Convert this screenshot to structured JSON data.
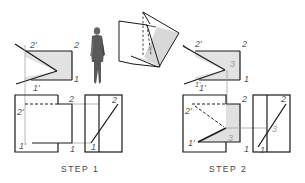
{
  "figure": {
    "steps": [
      {
        "caption": "STEP 1",
        "top_view": {
          "labels": {
            "p2_prime": "2'",
            "p2": "2",
            "p1": "1",
            "p1_prime": "1'"
          }
        },
        "front_view": {
          "labels": {
            "p2": "2",
            "p2_prime": "2'",
            "p1_prime": "1'",
            "p1": "1"
          }
        },
        "side_view": {
          "labels": {
            "p2": "2",
            "p1": "1"
          }
        }
      },
      {
        "caption": "STEP 2",
        "top_view": {
          "labels": {
            "p2_prime": "2'",
            "p2": "2",
            "p1": "1",
            "p1_prime": "1'",
            "p3": "3"
          }
        },
        "front_view": {
          "labels": {
            "p1_top": "1'",
            "p2": "2",
            "p2_prime": "2'",
            "p1_prime": "1'",
            "p1": "1",
            "p3": "3"
          }
        },
        "side_view": {
          "labels": {
            "p2": "2",
            "p1": "1",
            "p3": "3"
          }
        }
      }
    ],
    "illustration": {
      "observer": "human-figure",
      "pictorial": "intersecting-planes-3d"
    },
    "colors": {
      "line": "#1a1a1a",
      "projection_line": "#9a9a9a",
      "shaded_fill": "#e2e2e2",
      "label": "#555555"
    }
  }
}
